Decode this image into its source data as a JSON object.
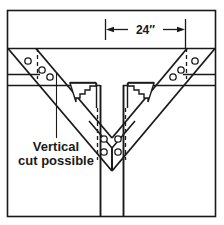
{
  "drawing": {
    "title": "Structural steel V-brace to column connection detail",
    "canvas": {
      "width": 224,
      "height": 225,
      "background": "#ffffff"
    },
    "colors": {
      "line": "#1a1a1a",
      "thin_line": "#3a3a3a",
      "background": "#ffffff",
      "hole_fill": "#ffffff"
    },
    "frame": {
      "x": 7,
      "y": 10,
      "width": 209,
      "height": 207
    },
    "dimension": {
      "label": "24″",
      "value": 24,
      "unit": "inches",
      "line_y": 30,
      "left_x": 105,
      "right_x": 185,
      "arrow_direction": "outward",
      "extension_top_y": 18,
      "extension_bottom_y": 48
    },
    "annotation": {
      "line1": "Vertical",
      "line2": "cut possible",
      "text_x": 56,
      "text_line1_y": 149,
      "text_line2_y": 163,
      "leader": {
        "x": 56,
        "y_top": 72,
        "y_bottom": 138
      }
    },
    "beam": {
      "name": "horizontal-beam",
      "top_flange_y": 48,
      "bottom_flange_y": 85,
      "left_x": 7,
      "right_x": 216
    },
    "column": {
      "name": "vertical-column",
      "left_x": 100,
      "right_x": 123,
      "top_y": 85,
      "bottom_y": 217
    },
    "braces": {
      "left": {
        "name": "left-diagonal-brace",
        "holes": [
          {
            "cx": 28,
            "cy": 61,
            "r": 3.2
          },
          {
            "cx": 42,
            "cy": 70,
            "r": 3.2
          },
          {
            "cx": 50,
            "cy": 77,
            "r": 3.2
          }
        ],
        "dashed_cut_x": 37,
        "dashed_top_y": 48,
        "dashed_bottom_y": 78
      },
      "right": {
        "name": "right-diagonal-brace",
        "holes": [
          {
            "cx": 195,
            "cy": 61,
            "r": 3.2
          },
          {
            "cx": 181,
            "cy": 70,
            "r": 3.2
          },
          {
            "cx": 173,
            "cy": 77,
            "r": 3.2
          }
        ],
        "dashed_cut_x": 186,
        "dashed_top_y": 48,
        "dashed_bottom_y": 78
      }
    },
    "gusset_holes": [
      {
        "cx": 104,
        "cy": 139,
        "r": 3.2
      },
      {
        "cx": 118,
        "cy": 139,
        "r": 3.2
      },
      {
        "cx": 104,
        "cy": 152,
        "r": 3.2
      },
      {
        "cx": 118,
        "cy": 152,
        "r": 3.2
      }
    ],
    "center_dashed_lines": [
      {
        "x": 97,
        "y_top": 108,
        "y_bottom": 160
      },
      {
        "x": 125,
        "y_top": 108,
        "y_bottom": 160
      }
    ],
    "notch_detail": {
      "name": "stepped-cope-cut",
      "description": "Stepped / staircase cut profile at beam-to-column web, mirrored left and right",
      "left_origin_x": 70,
      "right_origin_x": 153,
      "top_y": 82,
      "steps": 5
    }
  }
}
